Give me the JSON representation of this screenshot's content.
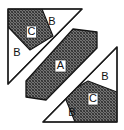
{
  "figure": {
    "background_color": "#ffffff",
    "outline_color": "#1a1a1a",
    "hatch_color": "#3a3a3a",
    "plain_fill": "#ffffff",
    "labels": [
      {
        "id": "label-c-top",
        "text": "C",
        "x": 31,
        "y": 32,
        "boxed": true
      },
      {
        "id": "label-b-top",
        "text": "B",
        "x": 52,
        "y": 22,
        "boxed": false
      },
      {
        "id": "label-b-left",
        "text": "B",
        "x": 17,
        "y": 53,
        "boxed": false
      },
      {
        "id": "label-a-center",
        "text": "A",
        "x": 60,
        "y": 66,
        "boxed": true
      },
      {
        "id": "label-b-right",
        "text": "B",
        "x": 105,
        "y": 77,
        "boxed": false
      },
      {
        "id": "label-c-bottom",
        "text": "C",
        "x": 93,
        "y": 99,
        "boxed": true
      },
      {
        "id": "label-b-bottom",
        "text": "B",
        "x": 72,
        "y": 113,
        "boxed": false
      }
    ],
    "shapes": [
      {
        "id": "top-left-triangle",
        "role": "upper-left right triangle outline",
        "points": "8,9 82,9 8,84",
        "fill": "plain"
      },
      {
        "id": "top-left-hatched-band",
        "role": "region C in upper-left triangle",
        "points": "8,9 41,9 51,37 8,37",
        "fill": "hatch"
      },
      {
        "id": "center-band",
        "role": "region A central diagonal band",
        "points": "74,30 97,30 97,46 44,99 29,99 29,83",
        "fill": "hatch"
      },
      {
        "id": "bottom-right-triangle",
        "role": "lower-right right triangle outline",
        "points": "43,122 117,122 117,47",
        "fill": "plain"
      },
      {
        "id": "bottom-right-hatched-band",
        "role": "region C in lower-right triangle",
        "points": "117,94 117,122 74,122 64,94",
        "fill": "hatch"
      }
    ]
  }
}
